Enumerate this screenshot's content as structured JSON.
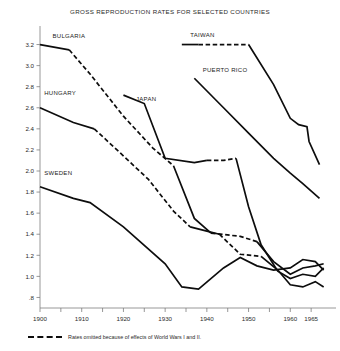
{
  "chart_data": {
    "type": "line",
    "title": "GROSS REPRODUCTION RATES FOR SELECTED COUNTRIES",
    "xlabel": "",
    "ylabel": "",
    "xlim": [
      1900,
      1970
    ],
    "ylim": [
      0.7,
      3.3
    ],
    "grid": false,
    "legend": "inline-labels",
    "yticks": [
      "3.2",
      "3.0",
      "2.8",
      "2.6",
      "2.4",
      "2.2",
      "2.0",
      "1.8",
      "1.6",
      "1.4",
      "1.2",
      "1.0",
      ".8"
    ],
    "ytick_values": [
      3.2,
      3.0,
      2.8,
      2.6,
      2.4,
      2.2,
      2.0,
      1.8,
      1.6,
      1.4,
      1.2,
      1.0,
      0.8
    ],
    "xticks": [
      1900,
      1905,
      1910,
      1915,
      1920,
      1925,
      1930,
      1935,
      1940,
      1945,
      1950,
      1955,
      1960,
      1965
    ],
    "xtick_labels": [
      {
        "value": 1900,
        "label": "1900"
      },
      {
        "value": 1910,
        "label": "1910"
      },
      {
        "value": 1920,
        "label": "1920"
      },
      {
        "value": 1930,
        "label": "1930"
      },
      {
        "value": 1940,
        "label": "1940"
      },
      {
        "value": 1950,
        "label": "1950"
      },
      {
        "value": 1960,
        "label": "1960"
      },
      {
        "value": 1965,
        "label": "1965"
      }
    ],
    "annotation": "Rates omitted because of effects of World Wars I and II.",
    "series": [
      {
        "name": "BULGARIA",
        "label": "BULGARIA",
        "label_x": 1903,
        "label_y": 3.26,
        "segments": [
          {
            "style": "solid",
            "points": [
              [
                1900,
                3.2
              ],
              [
                1907,
                3.15
              ]
            ]
          },
          {
            "style": "dashed",
            "points": [
              [
                1907,
                3.15
              ],
              [
                1912,
                2.92
              ],
              [
                1920,
                2.52
              ],
              [
                1927,
                2.22
              ],
              [
                1932,
                2.05
              ]
            ]
          },
          {
            "style": "solid",
            "points": [
              [
                1932,
                2.05
              ],
              [
                1937,
                1.55
              ],
              [
                1941,
                1.41
              ]
            ]
          },
          {
            "style": "dashed",
            "points": [
              [
                1941,
                1.41
              ],
              [
                1948,
                1.38
              ],
              [
                1952,
                1.33
              ]
            ]
          },
          {
            "style": "solid",
            "points": [
              [
                1952,
                1.33
              ],
              [
                1956,
                1.14
              ],
              [
                1960,
                1.02
              ],
              [
                1963,
                1.08
              ],
              [
                1966,
                1.1
              ],
              [
                1968,
                1.12
              ]
            ]
          }
        ]
      },
      {
        "name": "HUNGARY",
        "label": "HUNGARY",
        "label_x": 1901,
        "label_y": 2.72,
        "segments": [
          {
            "style": "solid",
            "points": [
              [
                1900,
                2.6
              ],
              [
                1908,
                2.46
              ],
              [
                1913,
                2.4
              ]
            ]
          },
          {
            "style": "dashed",
            "points": [
              [
                1913,
                2.4
              ],
              [
                1919,
                2.18
              ],
              [
                1926,
                1.92
              ],
              [
                1932,
                1.62
              ],
              [
                1936,
                1.47
              ]
            ]
          },
          {
            "style": "solid",
            "points": [
              [
                1936,
                1.47
              ],
              [
                1940,
                1.43
              ],
              [
                1943,
                1.4
              ]
            ]
          },
          {
            "style": "dashed",
            "points": [
              [
                1943,
                1.4
              ],
              [
                1948,
                1.21
              ],
              [
                1953,
                1.19
              ]
            ]
          },
          {
            "style": "solid",
            "points": [
              [
                1953,
                1.19
              ],
              [
                1957,
                1.06
              ],
              [
                1960,
                0.92
              ],
              [
                1963,
                0.9
              ],
              [
                1966,
                0.95
              ],
              [
                1968,
                0.9
              ]
            ]
          }
        ]
      },
      {
        "name": "SWEDEN",
        "label": "SWEDEN",
        "label_x": 1901,
        "label_y": 1.96,
        "segments": [
          {
            "style": "solid",
            "points": [
              [
                1900,
                1.85
              ],
              [
                1908,
                1.74
              ],
              [
                1912,
                1.7
              ],
              [
                1920,
                1.47
              ],
              [
                1930,
                1.12
              ],
              [
                1934,
                0.9
              ],
              [
                1938,
                0.88
              ],
              [
                1944,
                1.08
              ],
              [
                1948,
                1.18
              ],
              [
                1952,
                1.1
              ],
              [
                1956,
                1.06
              ],
              [
                1960,
                1.08
              ],
              [
                1963,
                1.16
              ],
              [
                1966,
                1.14
              ],
              [
                1968,
                1.06
              ]
            ]
          }
        ]
      },
      {
        "name": "JAPAN",
        "label": "JAPAN",
        "label_x": 1923,
        "label_y": 2.66,
        "segments": [
          {
            "style": "solid",
            "points": [
              [
                1920,
                2.72
              ],
              [
                1925,
                2.64
              ],
              [
                1930,
                2.12
              ],
              [
                1937,
                2.08
              ],
              [
                1940,
                2.1
              ]
            ]
          },
          {
            "style": "dashed",
            "points": [
              [
                1940,
                2.1
              ],
              [
                1944,
                2.1
              ],
              [
                1947,
                2.12
              ]
            ]
          },
          {
            "style": "solid",
            "points": [
              [
                1947,
                2.12
              ],
              [
                1950,
                1.66
              ],
              [
                1953,
                1.3
              ],
              [
                1957,
                1.05
              ],
              [
                1960,
                0.98
              ],
              [
                1963,
                1.02
              ],
              [
                1966,
                1.0
              ],
              [
                1968,
                1.08
              ]
            ]
          }
        ]
      },
      {
        "name": "TAIWAN",
        "label": "TAIWAN",
        "label_x": 1936,
        "label_y": 3.27,
        "segments": [
          {
            "style": "solid",
            "points": [
              [
                1934,
                3.2
              ],
              [
                1938,
                3.2
              ]
            ]
          },
          {
            "style": "dashed",
            "points": [
              [
                1938,
                3.2
              ],
              [
                1944,
                3.2
              ],
              [
                1950,
                3.2
              ]
            ]
          },
          {
            "style": "solid",
            "points": [
              [
                1950,
                3.2
              ],
              [
                1956,
                2.82
              ],
              [
                1960,
                2.5
              ],
              [
                1962,
                2.44
              ],
              [
                1964,
                2.42
              ],
              [
                1964.5,
                2.28
              ],
              [
                1967,
                2.06
              ]
            ]
          }
        ]
      },
      {
        "name": "PUERTO RICO",
        "label": "PUERTO RICO",
        "label_x": 1939,
        "label_y": 2.94,
        "segments": [
          {
            "style": "solid",
            "points": [
              [
                1937,
                2.88
              ],
              [
                1944,
                2.6
              ],
              [
                1950,
                2.36
              ],
              [
                1956,
                2.12
              ],
              [
                1960,
                1.98
              ],
              [
                1963,
                1.88
              ],
              [
                1967,
                1.74
              ]
            ]
          }
        ]
      }
    ]
  }
}
